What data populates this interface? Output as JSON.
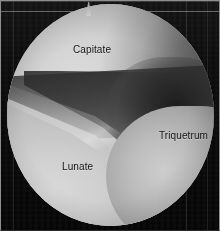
{
  "figure": {
    "kind": "wrist-arthroscopy-photograph",
    "field_of_view": "circular",
    "background_color": "#0a0a0a",
    "scope_field_color": "#b0b0b0",
    "label_color": "#141414"
  },
  "labels": [
    {
      "id": "capitate",
      "text": "Capitate"
    },
    {
      "id": "triquetrum",
      "text": "Triquetrum"
    },
    {
      "id": "lunate",
      "text": "Lunate"
    }
  ],
  "structures": {
    "capitate": "Capitate",
    "triquetrum": "Triquetrum",
    "lunate": "Lunate",
    "joint_space": "Joint space"
  }
}
